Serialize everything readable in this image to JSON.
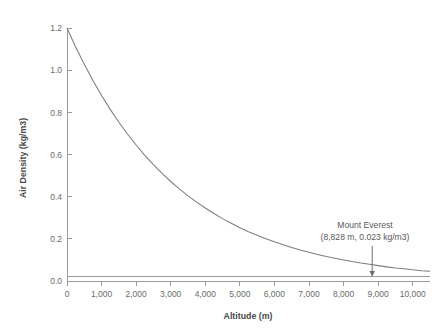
{
  "chart_data": {
    "type": "line",
    "title": "",
    "xlabel": "Altitude (m)",
    "ylabel": "Air Density (kg/m3)",
    "xlim": [
      0,
      10500
    ],
    "ylim": [
      0.0,
      1.2
    ],
    "grid": false,
    "legend": "none",
    "x_ticks": [
      0,
      1000,
      2000,
      3000,
      4000,
      5000,
      6000,
      7000,
      8000,
      9000,
      10000
    ],
    "x_tick_labels": [
      "0",
      "1,000",
      "2,000",
      "3,000",
      "4,000",
      "5,000",
      "6,000",
      "7,000",
      "8,000",
      "9,000",
      "10,000"
    ],
    "y_ticks": [
      0.0,
      0.2,
      0.4,
      0.6,
      0.8,
      1.0,
      1.2
    ],
    "y_tick_labels": [
      "0.0",
      "0.2",
      "0.4",
      "0.6",
      "0.8",
      "1.0",
      "1.2"
    ],
    "series": [
      {
        "name": "Air Density",
        "color": "#7d7d7d",
        "x": [
          0,
          250,
          500,
          750,
          1000,
          1250,
          1500,
          1750,
          2000,
          2250,
          2500,
          2750,
          3000,
          3250,
          3500,
          3750,
          4000,
          4250,
          4500,
          4750,
          5000,
          5250,
          5500,
          5750,
          6000,
          6250,
          6500,
          6750,
          7000,
          7250,
          7500,
          7750,
          8000,
          8250,
          8500,
          8750,
          9000,
          9250,
          9500,
          9750,
          10000,
          10250,
          10500
        ],
        "y": [
          1.2,
          1.11,
          1.028,
          0.951,
          0.88,
          0.814,
          0.753,
          0.697,
          0.645,
          0.596,
          0.552,
          0.51,
          0.472,
          0.437,
          0.404,
          0.374,
          0.346,
          0.32,
          0.296,
          0.274,
          0.253,
          0.234,
          0.217,
          0.2,
          0.186,
          0.172,
          0.159,
          0.147,
          0.136,
          0.126,
          0.116,
          0.108,
          0.1,
          0.092,
          0.085,
          0.079,
          0.073,
          0.067,
          0.062,
          0.058,
          0.053,
          0.049,
          0.046
        ]
      }
    ],
    "reference_lines": [
      {
        "name": "everest-density-line",
        "orientation": "horizontal",
        "value": 0.023,
        "color": "#9a9a9a"
      }
    ],
    "annotations": [
      {
        "name": "mount-everest",
        "line1": "Mount Everest",
        "line2": "(8,828 m, 0.023 kg/m3)",
        "point_x": 8828,
        "point_y": 0.023,
        "has_arrow": true
      }
    ]
  },
  "colors": {
    "curve": "#7d7d7d",
    "axis": "#9a9a9a",
    "text": "#5a5a5a",
    "background": "#ffffff"
  }
}
